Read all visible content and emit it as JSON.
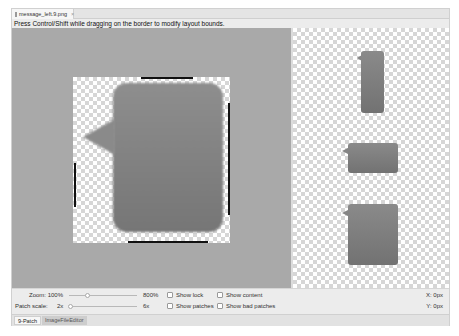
{
  "window": {
    "tab": {
      "filename": "message_left.9.png",
      "close_glyph": "×",
      "icon": "image-file-icon"
    },
    "hint": "Press Control/Shift while dragging on the border to modify layout bounds."
  },
  "editor": {
    "canvas_color": "#a9a9a9",
    "bubble_color": "#838383",
    "patch_marker_color": "#111111"
  },
  "preview": {
    "items": [
      {
        "name": "tall-stretch-preview"
      },
      {
        "name": "wide-stretch-preview"
      },
      {
        "name": "large-stretch-preview"
      }
    ]
  },
  "controls": {
    "zoom": {
      "label": "Zoom:",
      "value": "100%",
      "max": "800%"
    },
    "patch_scale": {
      "label": "Patch scale:",
      "value": "2x",
      "max": "6x"
    },
    "checkboxes": {
      "show_lock": {
        "label": "Show lock",
        "checked": false
      },
      "show_content": {
        "label": "Show content",
        "checked": false
      },
      "show_patches": {
        "label": "Show patches",
        "checked": false
      },
      "show_bad_patches": {
        "label": "Show bad patches",
        "checked": false
      }
    },
    "coords": {
      "x": "X: 0px",
      "y": "Y: 0px"
    }
  },
  "bottom_tabs": [
    {
      "label": "9-Patch",
      "active": true
    },
    {
      "label": "ImageFileEditor",
      "active": false
    }
  ]
}
